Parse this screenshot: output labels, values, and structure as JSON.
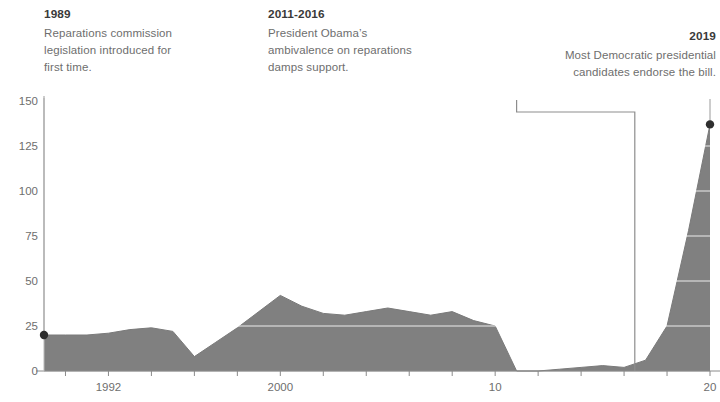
{
  "annotations": [
    {
      "id": "1989",
      "title": "1989",
      "body": "Reparations commission\nlegislation introduced for\nfirst time."
    },
    {
      "id": "2011-2016",
      "title": "2011-2016",
      "body": "President Obama’s\nambivalence on reparations\ndamps support."
    },
    {
      "id": "2019",
      "title": "2019",
      "body": "Most Democratic presidential\ncandidates endorse the bill."
    }
  ],
  "chart_data": {
    "type": "area",
    "title": "",
    "subtitle": "",
    "xlabel": "",
    "ylabel": "",
    "xlim": [
      1989,
      2020
    ],
    "ylim": [
      0,
      150
    ],
    "grid": true,
    "legend": null,
    "accent_color": "#808080",
    "marker_color": "#2f2f2f",
    "y_ticks": [
      0,
      25,
      50,
      75,
      100,
      125,
      150
    ],
    "y_tick_labels": [
      "0",
      "25",
      "50",
      "75",
      "100",
      "125",
      "150"
    ],
    "x_ticks": [
      1992,
      2000,
      2010,
      2020
    ],
    "x_tick_labels": [
      "1992",
      "2000",
      "10",
      "20"
    ],
    "x_minor_tick_step": 2,
    "x": [
      1989,
      1990,
      1991,
      1992,
      1993,
      1994,
      1995,
      1996,
      1997,
      1998,
      1999,
      2000,
      2001,
      2002,
      2003,
      2004,
      2005,
      2006,
      2007,
      2008,
      2009,
      2010,
      2011,
      2012,
      2013,
      2014,
      2015,
      2016,
      2017,
      2018,
      2019,
      2020
    ],
    "values": [
      20,
      20,
      20,
      21,
      23,
      24,
      22,
      8,
      16,
      24,
      33,
      42,
      36,
      32,
      31,
      33,
      35,
      33,
      31,
      33,
      28,
      25,
      0,
      0,
      1,
      2,
      3,
      2,
      6,
      25,
      78,
      137
    ],
    "markers": [
      {
        "x": 1989,
        "y": 20
      },
      {
        "x": 2020,
        "y": 137
      }
    ],
    "callouts": [
      {
        "label": "1989",
        "x": 1989
      },
      {
        "label": "2011-2016",
        "x_start": 2011,
        "x_end": 2016
      },
      {
        "label": "2019",
        "x": 2020
      }
    ]
  }
}
